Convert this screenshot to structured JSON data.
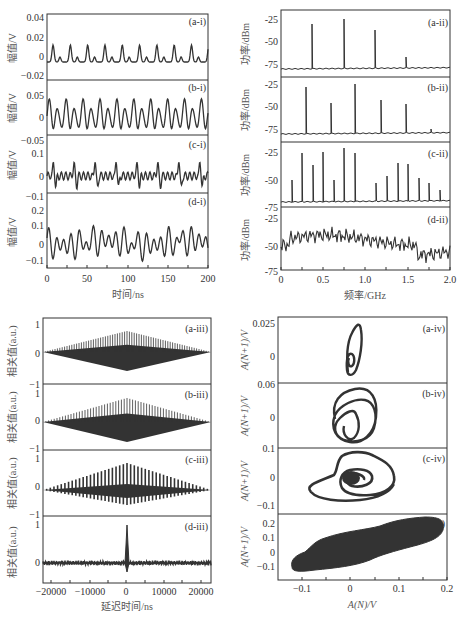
{
  "figure": {
    "background": "#ffffff",
    "trace_color": "#333333"
  },
  "chart_data": [
    {
      "id": "time-series",
      "type": "line",
      "xlabel": "时间/ns",
      "ylabel": "幅值/V",
      "xlim": [
        0,
        200
      ],
      "xticks": [
        "0",
        "50",
        "100",
        "150",
        "200"
      ],
      "panels": [
        {
          "tag": "(a-i)",
          "ylim": [
            -0.02,
            0.04
          ],
          "yticks": [
            "0.04",
            "0.02",
            "0",
            "−0.02"
          ],
          "description": "periodic oscillation, period ~20 ns, peaks ~0.025, secondary peaks ~0"
        },
        {
          "tag": "(b-i)",
          "ylim": [
            -0.06,
            0.07
          ],
          "yticks": [
            "0.05",
            "0",
            "−0.05"
          ],
          "description": "period-doubled oscillation, amplitude ~±0.05"
        },
        {
          "tag": "(c-i)",
          "ylim": [
            -0.13,
            0.14
          ],
          "yticks": [
            "0.1",
            "0",
            "−0.1"
          ],
          "description": "quasi-periodic oscillation with bursts, peaks ~0.09"
        },
        {
          "tag": "(d-i)",
          "ylim": [
            -0.17,
            0.22
          ],
          "yticks": [
            "0.2",
            "0.1",
            "0",
            "−0.1"
          ],
          "description": "chaotic irregular oscillation, peaks up to ~0.16"
        }
      ]
    },
    {
      "id": "power-spectra",
      "type": "line",
      "xlabel": "频率/GHz",
      "ylabel": "功率/dBm",
      "xlim": [
        0,
        2.0
      ],
      "xticks": [
        "0",
        "0.5",
        "1.0",
        "1.5",
        "2.0"
      ],
      "panels": [
        {
          "tag": "(a-ii)",
          "ylim": [
            -85,
            -15
          ],
          "yticks": [
            "-25",
            "-50",
            "-75"
          ],
          "peaks": [
            [
              0.37,
              -30
            ],
            [
              0.74,
              -28
            ],
            [
              1.11,
              -37
            ],
            [
              1.48,
              -64
            ]
          ],
          "noise_floor": -80
        },
        {
          "tag": "(b-ii)",
          "ylim": [
            -85,
            -15
          ],
          "yticks": [
            "-25",
            "-50",
            "-75"
          ],
          "peaks": [
            [
              0.29,
              -27
            ],
            [
              0.59,
              -43
            ],
            [
              0.88,
              -22
            ],
            [
              1.18,
              -37
            ],
            [
              1.48,
              -44
            ],
            [
              1.77,
              -74
            ]
          ],
          "noise_floor": -80
        },
        {
          "tag": "(c-ii)",
          "ylim": [
            -75,
            -15
          ],
          "yticks": [
            "-25",
            "-50",
            "-75"
          ],
          "peaks": [
            [
              0.13,
              -53
            ],
            [
              0.25,
              -24
            ],
            [
              0.38,
              -36
            ],
            [
              0.5,
              -23
            ],
            [
              0.63,
              -50
            ],
            [
              0.75,
              -20
            ],
            [
              0.88,
              -25
            ],
            [
              1.0,
              -21
            ],
            [
              1.13,
              -54
            ],
            [
              1.25,
              -46
            ],
            [
              1.38,
              -34
            ],
            [
              1.5,
              -35
            ],
            [
              1.63,
              -48
            ],
            [
              1.75,
              -53
            ],
            [
              1.88,
              -60
            ]
          ],
          "noise_floor": -67
        },
        {
          "tag": "(d-ii)",
          "ylim": [
            -75,
            -15
          ],
          "yticks": [
            "-25",
            "-50",
            "-75"
          ],
          "description": "broadband spectrum around -40 to -50 dBm, dropping to ~-60 above 1.6 GHz"
        }
      ]
    },
    {
      "id": "autocorrelation",
      "type": "line",
      "xlabel": "延迟时间/ns",
      "ylabel": "相关值(a.u.)",
      "xlim": [
        -22000,
        22000
      ],
      "xticks": [
        "−20000",
        "−10000",
        "0",
        "10000",
        "20000"
      ],
      "panels": [
        {
          "tag": "(a-iii)",
          "ylim": [
            -1,
            1.2
          ],
          "yticks": [
            "1",
            "0",
            "−1"
          ],
          "description": "dense diamond envelope, peak 1 at 0, min ~-0.6"
        },
        {
          "tag": "(b-iii)",
          "ylim": [
            -1,
            1.2
          ],
          "yticks": [
            "1",
            "0",
            "−1"
          ],
          "description": "diamond envelope, max 1, min ~-0.8"
        },
        {
          "tag": "(c-iii)",
          "ylim": [
            -1,
            1.2
          ],
          "yticks": [
            "1",
            "0",
            "−1"
          ],
          "description": "triangular envelope of comb peaks, max 1 at 0, min ~-0.6"
        },
        {
          "tag": "(d-iii)",
          "ylim": [
            -0.6,
            1.2
          ],
          "yticks": [
            "1",
            "0"
          ],
          "description": "single sharp peak of 1 at 0 delay, near-zero elsewhere"
        }
      ]
    },
    {
      "id": "phase-portraits",
      "type": "scatter",
      "xlabel": "A(N)/V",
      "ylabel": "A(N+1)/V",
      "xlim": [
        -0.15,
        0.2
      ],
      "xticks": [
        "−0.1",
        "0",
        "0.1",
        "0.2"
      ],
      "panels": [
        {
          "tag": "(a-iv)",
          "yticks": [
            "0.025",
            "0"
          ],
          "description": "small closed loop near origin"
        },
        {
          "tag": "(b-iv)",
          "yticks": [
            "0.06",
            "0"
          ],
          "description": "double loop attractor"
        },
        {
          "tag": "(c-iv)",
          "yticks": [
            "0.1",
            "0",
            "−0.1"
          ],
          "description": "spiral torus-like attractor"
        },
        {
          "tag": "(d-iv)",
          "yticks": [
            "0.2",
            "0.1",
            "0",
            "−0.1"
          ],
          "description": "filled elongated chaotic attractor from (-0.12,-0.1) to (0.19,0.15)"
        }
      ]
    }
  ],
  "labels": {
    "ts_xlabel": "时间/ns",
    "ts_ylabel": "幅值/V",
    "ps_xlabel": "频率/GHz",
    "ps_ylabel": "功率/dBm",
    "ac_xlabel": "延迟时间/ns",
    "ac_ylabel": "相关值(a.u.)",
    "pp_xlabel": "A(N)/V",
    "pp_ylabel": "A(N+1)/V",
    "tags": {
      "ai": "(a-i)",
      "bi": "(b-i)",
      "ci": "(c-i)",
      "di": "(d-i)",
      "aii": "(a-ii)",
      "bii": "(b-ii)",
      "cii": "(c-ii)",
      "dii": "(d-ii)",
      "aiii": "(a-iii)",
      "biii": "(b-iii)",
      "ciii": "(c-iii)",
      "diii": "(d-iii)",
      "aiv": "(a-iv)",
      "biv": "(b-iv)",
      "civ": "(c-iv)",
      "div": "(d-iv)"
    },
    "ts_yticks": {
      "a": [
        "0.04",
        "0.02",
        "0",
        "−0.02"
      ],
      "b": [
        "0.05",
        "0",
        "−0.05"
      ],
      "c": [
        "0.1",
        "0",
        "−0.1"
      ],
      "d": [
        "0.2",
        "0.1",
        "0",
        "−0.1"
      ]
    },
    "ts_xticks": [
      "0",
      "50",
      "100",
      "150",
      "200"
    ],
    "ps_yticks": [
      "-25",
      "-50",
      "-75"
    ],
    "ps_yticks_last": "-75",
    "ps_xticks": [
      "0",
      "0.5",
      "1.0",
      "1.5",
      "2.0"
    ],
    "ac_yticks": [
      "1",
      "0",
      "−1"
    ],
    "ac_xticks": [
      "−20000",
      "−10000",
      "0",
      "10000",
      "20000"
    ],
    "pp_yticks": {
      "a": [
        "0.025",
        "0"
      ],
      "b_top": "0.06",
      "b": [
        "0"
      ],
      "c_top": "0.1",
      "c": [
        "0",
        "−0.1"
      ],
      "d": [
        "0.2",
        "0.1",
        "0",
        "−0.1"
      ]
    },
    "pp_xticks": [
      "−0.1",
      "0",
      "0.1",
      "0.2"
    ]
  }
}
